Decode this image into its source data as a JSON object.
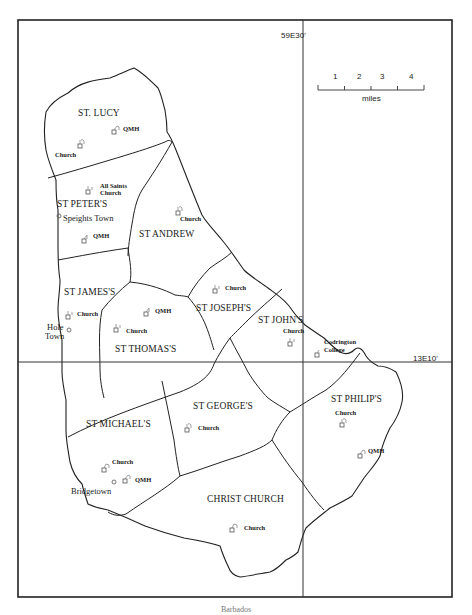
{
  "map": {
    "coordinates": {
      "longitude_label": "59E30'",
      "latitude_label": "13E10'"
    },
    "scale_bar": {
      "ticks": [
        "1",
        "2",
        "3",
        "4"
      ],
      "unit": "miles"
    },
    "parishes": [
      {
        "id": "st-lucy",
        "label": "ST. LUCY"
      },
      {
        "id": "st-peters",
        "label": "ST PETER'S"
      },
      {
        "id": "st-andrew",
        "label": "ST ANDREW"
      },
      {
        "id": "st-james",
        "label": "ST JAMES'S"
      },
      {
        "id": "st-thomas",
        "label": "ST THOMAS'S"
      },
      {
        "id": "st-josephs",
        "label": "ST JOSEPH'S"
      },
      {
        "id": "st-johns",
        "label": "ST JOHN'S"
      },
      {
        "id": "st-michaels",
        "label": "ST MICHAEL'S"
      },
      {
        "id": "st-georges",
        "label": "ST GEORGE'S"
      },
      {
        "id": "st-philips",
        "label": "ST PHILIP'S"
      },
      {
        "id": "christ-church",
        "label": "CHRIST CHURCH"
      }
    ],
    "towns": [
      {
        "id": "speightstown",
        "label": "Speights Town"
      },
      {
        "id": "holetown",
        "label": "Hole\nTown",
        "line1": "Hole",
        "line2": "Town"
      },
      {
        "id": "bridgetown",
        "label": "Bridgetown"
      }
    ],
    "markers": [
      {
        "id": "st-lucy-church",
        "label": "Church"
      },
      {
        "id": "st-lucy-qmh",
        "label": "QMH"
      },
      {
        "id": "all-saints-church",
        "line1": "All Saints",
        "line2": "Church"
      },
      {
        "id": "st-peters-qmh",
        "label": "QMH"
      },
      {
        "id": "st-andrew-church",
        "label": "Church"
      },
      {
        "id": "st-james-church",
        "label": "Church"
      },
      {
        "id": "st-thomas-qmh",
        "label": "QMH"
      },
      {
        "id": "st-thomas-church",
        "label": "Church"
      },
      {
        "id": "st-joseph-church",
        "label": "Church"
      },
      {
        "id": "st-john-church",
        "label": "Church"
      },
      {
        "id": "codrington-college",
        "line1": "Codrington",
        "line2": "College"
      },
      {
        "id": "st-philip-church",
        "label": "Church"
      },
      {
        "id": "st-philip-qmh",
        "label": "QMH"
      },
      {
        "id": "st-george-church",
        "label": "Church"
      },
      {
        "id": "st-michael-church",
        "label": "Church"
      },
      {
        "id": "st-michael-qmh",
        "label": "QMH"
      },
      {
        "id": "christ-church-church",
        "label": "Church"
      }
    ]
  },
  "caption": {
    "text": "Barbados"
  },
  "colors": {
    "ink": "#222222",
    "background": "#ffffff"
  }
}
